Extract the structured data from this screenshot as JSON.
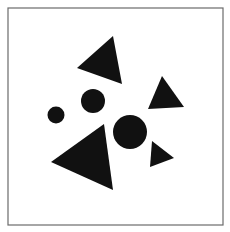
{
  "figure": {
    "background": "#ffffff",
    "frame": {
      "x": 8,
      "y": 8,
      "width": 215,
      "height": 217,
      "stroke": "#6b6b6b",
      "stroke_width": 1.2
    },
    "fill": "#111111",
    "triangles": [
      {
        "id": "top",
        "points": "113,36 77,68 122,84"
      },
      {
        "id": "right",
        "points": "162,76 148,109 184,107"
      },
      {
        "id": "bottom-large",
        "points": "104,124 51,162 113,190"
      },
      {
        "id": "bottom-right-small",
        "points": "152,141 174,158 150,167"
      }
    ],
    "circles": [
      {
        "id": "small-left",
        "cx": 56,
        "cy": 115,
        "r": 8.5
      },
      {
        "id": "medium",
        "cx": 93,
        "cy": 101,
        "r": 12
      },
      {
        "id": "large",
        "cx": 130,
        "cy": 132,
        "r": 17
      }
    ]
  }
}
